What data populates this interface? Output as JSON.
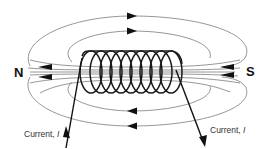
{
  "diagram": {
    "labels": {
      "north_pole": "N",
      "south_pole": "S",
      "current_left": "Current, ",
      "current_left_symbol": "I",
      "current_right": "Current, ",
      "current_right_symbol": "I"
    },
    "colors": {
      "field_line": "#8a8a8a",
      "coil": "#1a1a1a",
      "arrow": "#111111",
      "text": "#111111",
      "background": "#ffffff"
    },
    "coil": {
      "turns": 9
    },
    "field_lines": {
      "outer_loops_top": 2,
      "outer_loops_bottom": 2,
      "axial_lines": 6,
      "top_arrow_direction": "right",
      "bottom_arrow_direction": "left",
      "pole_arrow_direction": "left"
    },
    "current": {
      "left_direction": "up",
      "right_direction": "down"
    }
  }
}
